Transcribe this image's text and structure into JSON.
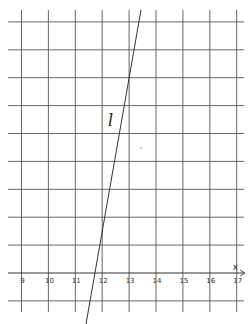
{
  "diagram": {
    "type": "coordinate-grid-with-line",
    "x_axis": {
      "label": "x",
      "ticks": [
        "9",
        "10",
        "11",
        "12",
        "13",
        "14",
        "15",
        "16",
        "17"
      ],
      "min": 9,
      "max": 17
    },
    "line": {
      "label": "l",
      "passes_through_grid": [
        {
          "x": 12,
          "row_from_axis": 2
        },
        {
          "x": 13,
          "row_from_axis": 7
        }
      ],
      "slope_grid_units": 5
    },
    "colors": {
      "grid": "#555555",
      "line": "#333333",
      "background": "#ffffff"
    }
  }
}
